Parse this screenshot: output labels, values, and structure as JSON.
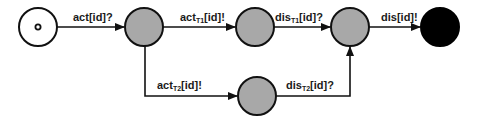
{
  "diagram": {
    "type": "state-machine",
    "colors": {
      "stroke": "#111111",
      "state_fill": "#a8a8a8",
      "final_fill": "#000000",
      "background": "#ffffff"
    },
    "states": [
      {
        "id": "initial",
        "kind": "initial"
      },
      {
        "id": "s1",
        "kind": "state"
      },
      {
        "id": "s2",
        "kind": "state"
      },
      {
        "id": "s3",
        "kind": "state"
      },
      {
        "id": "s4",
        "kind": "state"
      },
      {
        "id": "final",
        "kind": "final"
      }
    ],
    "transitions": [
      {
        "from": "initial",
        "to": "s1",
        "label": {
          "base": "act",
          "sub": "",
          "rest": "[id]?"
        }
      },
      {
        "from": "s1",
        "to": "s2",
        "label": {
          "base": "act",
          "sub": "T1",
          "rest": "[id]!"
        }
      },
      {
        "from": "s2",
        "to": "s3",
        "label": {
          "base": "dis",
          "sub": "T1",
          "rest": "[id]?"
        }
      },
      {
        "from": "s3",
        "to": "final",
        "label": {
          "base": "dis",
          "sub": "",
          "rest": "[id]!"
        }
      },
      {
        "from": "s1",
        "to": "s4",
        "label": {
          "base": "act",
          "sub": "T2",
          "rest": "[id]!"
        }
      },
      {
        "from": "s4",
        "to": "s3",
        "label": {
          "base": "dis",
          "sub": "T2",
          "rest": "[id]?"
        }
      }
    ]
  }
}
